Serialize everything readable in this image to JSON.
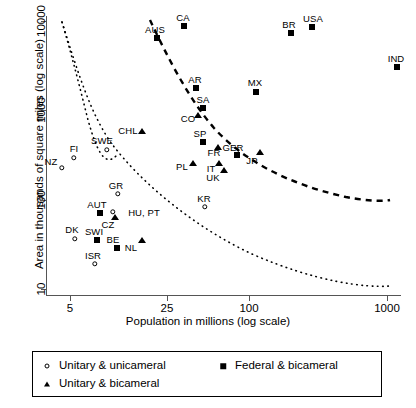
{
  "chart_data": {
    "type": "scatter",
    "title": "",
    "xlabel": "Population in millions (log scale)",
    "ylabel": "Area in thousands of square miles (log scale)",
    "xscale": "log",
    "yscale": "log",
    "xticks": [
      5,
      25,
      100,
      1000
    ],
    "xtick_labels": [
      "5",
      "25",
      "100",
      "1000"
    ],
    "yticks": [
      10,
      100,
      1000,
      10000
    ],
    "ytick_labels": [
      "10",
      "100",
      "1000",
      "10000"
    ],
    "xlim": [
      4,
      1400
    ],
    "ylim": [
      9,
      13000
    ],
    "grid": false,
    "legend_position": "below-axes",
    "series": [
      {
        "name": "Unitary & unicameral",
        "marker": "circle",
        "points": [
          {
            "label": "NZ",
            "px": 62,
            "py": 168,
            "lx": 51,
            "ly": 161
          },
          {
            "label": "FI",
            "px": 74,
            "py": 158,
            "lx": 74,
            "ly": 148
          },
          {
            "label": "SWE",
            "px": 107,
            "py": 150,
            "lx": 102,
            "ly": 140
          },
          {
            "label": "GR",
            "px": 118,
            "py": 194,
            "lx": 116,
            "ly": 185
          },
          {
            "label": "HU, PT",
            "px": 113,
            "py": 212,
            "lx": 144,
            "ly": 212
          },
          {
            "label": "DK",
            "px": 75,
            "py": 239,
            "lx": 72,
            "ly": 229
          },
          {
            "label": "ISR",
            "px": 95,
            "py": 264,
            "lx": 93,
            "ly": 255
          },
          {
            "label": "KR",
            "px": 205,
            "py": 207,
            "lx": 204,
            "ly": 198
          }
        ]
      },
      {
        "name": "Unitary & bicameral",
        "marker": "triangle",
        "points": [
          {
            "label": "CHL",
            "px": 142,
            "py": 131,
            "lx": 128,
            "ly": 130
          },
          {
            "label": "CO",
            "px": 198,
            "py": 115,
            "lx": 188,
            "ly": 118
          },
          {
            "label": "FR",
            "px": 218,
            "py": 147,
            "lx": 214,
            "ly": 152
          },
          {
            "label": "JP",
            "px": 260,
            "py": 152,
            "lx": 252,
            "ly": 160
          },
          {
            "label": "PL",
            "px": 193,
            "py": 163,
            "lx": 182,
            "ly": 166
          },
          {
            "label": "IT",
            "px": 219,
            "py": 163,
            "lx": 211,
            "ly": 168
          },
          {
            "label": "UK",
            "px": 224,
            "py": 170,
            "lx": 213,
            "ly": 177
          },
          {
            "label": "CZ",
            "px": 115,
            "py": 217,
            "lx": 108,
            "ly": 224
          },
          {
            "label": "NL",
            "px": 142,
            "py": 240,
            "lx": 131,
            "ly": 247
          }
        ]
      },
      {
        "name": "Federal & bicameral",
        "marker": "square",
        "points": [
          {
            "label": "AUS",
            "px": 157,
            "py": 38,
            "lx": 155,
            "ly": 29
          },
          {
            "label": "CA",
            "px": 184,
            "py": 26,
            "lx": 183,
            "ly": 17
          },
          {
            "label": "BR",
            "px": 291,
            "py": 33,
            "lx": 289,
            "ly": 24
          },
          {
            "label": "USA",
            "px": 312,
            "py": 27,
            "lx": 313,
            "ly": 18
          },
          {
            "label": "AR",
            "px": 196,
            "py": 88,
            "lx": 195,
            "ly": 79
          },
          {
            "label": "MX",
            "px": 256,
            "py": 92,
            "lx": 255,
            "ly": 82
          },
          {
            "label": "IND",
            "px": 397,
            "py": 67,
            "lx": 396,
            "ly": 58
          },
          {
            "label": "SA",
            "px": 203,
            "py": 108,
            "lx": 203,
            "ly": 99
          },
          {
            "label": "SP",
            "px": 203,
            "py": 142,
            "lx": 200,
            "ly": 133
          },
          {
            "label": "GER",
            "px": 237,
            "py": 155,
            "lx": 233,
            "ly": 147
          },
          {
            "label": "AUT",
            "px": 100,
            "py": 213,
            "lx": 97,
            "ly": 204
          },
          {
            "label": "SWI",
            "px": 97,
            "py": 240,
            "lx": 94,
            "ly": 231
          },
          {
            "label": "BE",
            "px": 117,
            "py": 248,
            "lx": 113,
            "ly": 239
          }
        ]
      }
    ],
    "annotations": [
      {
        "name": "dashed-frontier-curve",
        "style": "dashed"
      },
      {
        "name": "dotted-frontier-curve",
        "style": "dotted"
      }
    ]
  },
  "legend": {
    "items": [
      {
        "marker": "circle",
        "label": "Unitary & unicameral"
      },
      {
        "marker": "square",
        "label": "Federal & bicameral"
      },
      {
        "marker": "triangle",
        "label": "Unitary & bicameral"
      }
    ]
  },
  "colors": {
    "marker": "#000000",
    "axis": "#555555",
    "background": "#ffffff"
  }
}
